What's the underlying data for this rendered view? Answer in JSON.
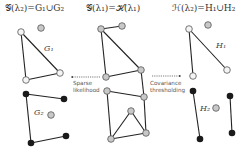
{
  "panels": {
    "left": {
      "title": "𝒢(λ₂)=G₁∪G₂",
      "label_g1": "G₁",
      "label_g2": "G₂"
    },
    "middle": {
      "title": "𝒢(λ₁)=ℋ(λ₁)"
    },
    "right": {
      "title": "ℋ(λ₂)=H₁∪H₂",
      "label_h1": "H₁",
      "label_h2": "H₂"
    }
  },
  "arrows": {
    "left": {
      "line1": "Sparse",
      "line2": "likelihood",
      "direction": "left"
    },
    "right": {
      "line1": "Covariance",
      "line2": "thresholding",
      "direction": "right"
    }
  },
  "colors": {
    "node_light": "#c8c8c8",
    "node_open": "#f4f4f4",
    "node_dark": "#1a1a1a",
    "edge": "#222222"
  }
}
